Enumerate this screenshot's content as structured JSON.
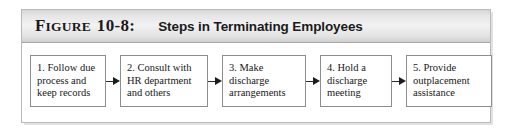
{
  "figure": {
    "label_first": "F",
    "label_rest": "IGURE",
    "number": "10-8:",
    "title": "Steps in Terminating Employees"
  },
  "flow": {
    "arrow_icon": "arrow-right-icon",
    "steps": [
      {
        "id": "step-1",
        "text": "1. Follow due\nprocess and\nkeep records"
      },
      {
        "id": "step-2",
        "text": "2. Consult with\nHR department\nand others"
      },
      {
        "id": "step-3",
        "text": "3. Make\ndischarge\narrangements"
      },
      {
        "id": "step-4",
        "text": "4. Hold a\ndischarge\nmeeting"
      },
      {
        "id": "step-5",
        "text": "5. Provide\noutplacement\nassistance"
      }
    ]
  },
  "colors": {
    "panel_border": "#b9b9b9",
    "header_band": "#e6e6e6",
    "box_border": "#8d8d8d",
    "text": "#181818",
    "arrow": "#1d1d1d"
  }
}
